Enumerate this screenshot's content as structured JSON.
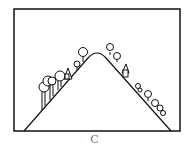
{
  "figure": {
    "caption": "C",
    "colors": {
      "stroke": "#111111",
      "background": "#ffffff",
      "caption": "#777777"
    }
  }
}
